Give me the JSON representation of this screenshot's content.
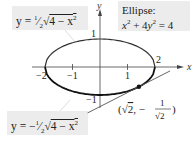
{
  "diagram": {
    "type": "ellipse-with-tangent",
    "labels": {
      "upper_half": "y = ½√(4 − x²)",
      "ellipse_title": "Ellipse:",
      "ellipse_equation": "x² + 4y² = 4",
      "lower_half": "y = −½√(4 − x²)",
      "point": "(√2, −1/√2)"
    },
    "axes": {
      "x_label": "x",
      "y_label": "y",
      "x_ticks": [
        "−2",
        "−1",
        "1",
        "2"
      ],
      "y_ticks": [
        "1",
        "−1"
      ]
    },
    "ellipse": {
      "a": 2,
      "b": 1,
      "center": [
        0,
        0
      ]
    },
    "point": {
      "x": 1.4142,
      "y": -0.7071
    },
    "tangent_line": {
      "slope": 0.5,
      "intercept": -1.4142
    },
    "colors": {
      "curve": "#111111",
      "axis": "#444444",
      "box_bg": "#ececec",
      "tangent": "#555555"
    }
  }
}
